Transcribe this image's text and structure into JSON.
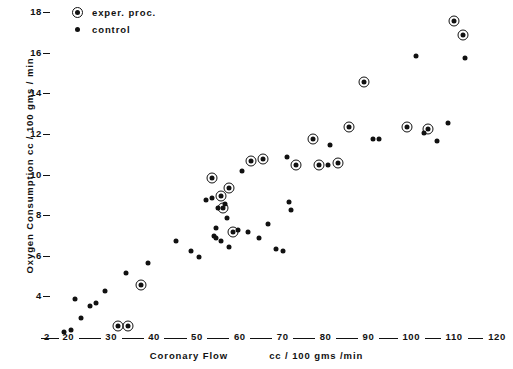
{
  "chart_data": {
    "type": "scatter",
    "title": "",
    "xlabel_main": "Coronary Flow",
    "xlabel_units": "cc / 100 gms /min",
    "ylabel": "Oxygen Consumption   cc / 100 gms / min",
    "xlim": [
      17,
      120
    ],
    "ylim": [
      2,
      18.6
    ],
    "xticks": [
      20,
      30,
      40,
      50,
      60,
      70,
      80,
      90,
      100,
      110,
      120
    ],
    "yticks": [
      2,
      4,
      6,
      8,
      10,
      12,
      14,
      16,
      18
    ],
    "grid": false,
    "legend_position": "top-left",
    "series": [
      {
        "name": "exper. proc.",
        "marker": "circled-dot",
        "color": "#111111",
        "points": [
          [
            31.5,
            2.6
          ],
          [
            34.0,
            2.6
          ],
          [
            37.0,
            4.6
          ],
          [
            58.5,
            7.2
          ],
          [
            56.0,
            8.4
          ],
          [
            55.5,
            9.0
          ],
          [
            57.5,
            9.4
          ],
          [
            53.5,
            9.9
          ],
          [
            62.5,
            10.7
          ],
          [
            65.5,
            10.8
          ],
          [
            73.0,
            10.5
          ],
          [
            78.5,
            10.5
          ],
          [
            77.0,
            11.8
          ],
          [
            83.0,
            10.6
          ],
          [
            85.5,
            12.4
          ],
          [
            89.0,
            14.6
          ],
          [
            99.0,
            12.4
          ],
          [
            104.0,
            12.3
          ],
          [
            110.0,
            17.6
          ],
          [
            112.0,
            16.9
          ]
        ]
      },
      {
        "name": "control",
        "marker": "dot",
        "color": "#111111",
        "points": [
          [
            19.0,
            2.3
          ],
          [
            20.5,
            2.4
          ],
          [
            23.0,
            3.0
          ],
          [
            21.5,
            3.9
          ],
          [
            25.0,
            3.6
          ],
          [
            26.5,
            3.7
          ],
          [
            28.5,
            4.3
          ],
          [
            33.5,
            5.2
          ],
          [
            38.5,
            5.7
          ],
          [
            45.0,
            6.8
          ],
          [
            48.5,
            6.3
          ],
          [
            50.5,
            6.0
          ],
          [
            52.0,
            8.8
          ],
          [
            53.5,
            8.9
          ],
          [
            55.0,
            8.4
          ],
          [
            54.5,
            7.4
          ],
          [
            54.0,
            7.0
          ],
          [
            54.5,
            6.9
          ],
          [
            55.5,
            6.8
          ],
          [
            56.5,
            8.6
          ],
          [
            57.0,
            7.9
          ],
          [
            57.5,
            6.5
          ],
          [
            59.5,
            7.3
          ],
          [
            60.5,
            10.2
          ],
          [
            62.0,
            7.2
          ],
          [
            64.5,
            6.9
          ],
          [
            66.5,
            7.6
          ],
          [
            68.5,
            6.4
          ],
          [
            70.0,
            6.3
          ],
          [
            71.0,
            10.9
          ],
          [
            71.5,
            8.7
          ],
          [
            72.0,
            8.3
          ],
          [
            80.5,
            10.5
          ],
          [
            81.0,
            11.5
          ],
          [
            91.0,
            11.8
          ],
          [
            92.5,
            11.8
          ],
          [
            101.0,
            15.9
          ],
          [
            103.0,
            12.1
          ],
          [
            106.0,
            11.7
          ],
          [
            108.5,
            12.6
          ],
          [
            112.5,
            15.8
          ]
        ]
      }
    ]
  },
  "legend": {
    "items": [
      {
        "label": "exper. proc.",
        "marker": "circled-dot"
      },
      {
        "label": "control",
        "marker": "dot"
      }
    ]
  }
}
